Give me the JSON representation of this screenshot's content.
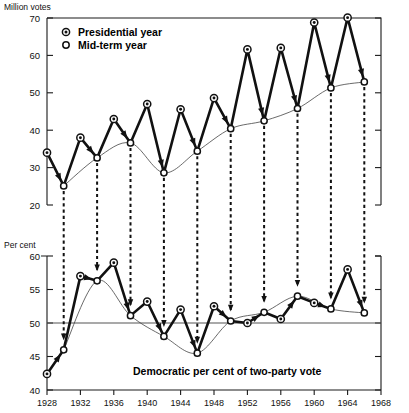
{
  "figure": {
    "background": "#ffffff",
    "ink_color": "#111111"
  },
  "legend": {
    "position": "top-left-inside",
    "entries": [
      {
        "marker": "presidential-year-marker-icon",
        "label": "Presidential year",
        "style": "circle-with-center-dot"
      },
      {
        "marker": "mid-term-year-marker-icon",
        "label": "Mid-term year",
        "style": "open-circle"
      }
    ]
  },
  "top_panel": {
    "axis_title": "Million votes",
    "y_ticks": [
      20,
      30,
      40,
      50,
      60,
      70
    ],
    "y_tick_labels": [
      "20",
      "30",
      "40",
      "50",
      "60",
      "70"
    ]
  },
  "bottom_panel": {
    "axis_title": "Per cent",
    "y_ticks": [
      40,
      45,
      50,
      55,
      60
    ],
    "y_tick_labels": [
      "40",
      "45",
      "50",
      "55",
      "60"
    ],
    "caption": "Democratic per cent of two-party vote",
    "reference_line_value": 50
  },
  "x_axis": {
    "ticks": [
      1928,
      1932,
      1936,
      1940,
      1944,
      1948,
      1952,
      1956,
      1960,
      1964,
      1968
    ],
    "tick_labels": [
      "1928",
      "1932",
      "1936",
      "1940",
      "1944",
      "1948",
      "1952",
      "1956",
      "1960",
      "1964",
      "1968"
    ],
    "range": [
      1928,
      1968
    ]
  },
  "chart_data": [
    {
      "type": "line",
      "id": "turnout-million-votes",
      "title": "Million votes",
      "xlabel": "",
      "ylabel": "Million votes",
      "xlim": [
        1928,
        1968
      ],
      "ylim": [
        20,
        70
      ],
      "grid": false,
      "legend_position": "upper left",
      "x": [
        1928,
        1930,
        1932,
        1934,
        1936,
        1938,
        1940,
        1942,
        1944,
        1946,
        1948,
        1950,
        1952,
        1954,
        1956,
        1958,
        1960,
        1962,
        1964,
        1966
      ],
      "series": [
        {
          "name": "Total vote",
          "point_types": [
            "presidential",
            "mid-term",
            "presidential",
            "mid-term",
            "presidential",
            "mid-term",
            "presidential",
            "mid-term",
            "presidential",
            "mid-term",
            "presidential",
            "mid-term",
            "presidential",
            "mid-term",
            "presidential",
            "mid-term",
            "presidential",
            "mid-term",
            "presidential",
            "mid-term"
          ],
          "values": [
            34.0,
            25.1,
            38.0,
            32.6,
            43.0,
            36.6,
            47.0,
            28.6,
            45.6,
            34.4,
            48.6,
            40.4,
            61.6,
            42.5,
            62.0,
            45.8,
            68.8,
            51.3,
            70.1,
            52.9
          ]
        },
        {
          "name": "Mid-term trend (smoothed)",
          "style": "thin-smooth-curve-through-mid-term-points",
          "values": [
            null,
            25.1,
            null,
            32.6,
            null,
            36.6,
            null,
            28.6,
            null,
            34.4,
            null,
            40.4,
            null,
            42.5,
            null,
            45.8,
            null,
            51.3,
            null,
            52.9
          ]
        }
      ],
      "annotations": {
        "arrows": "bold arrowheads on each presidential-to-mid-term descending segment",
        "drop_lines": "vertical dashed lines at each mid-term year linking the two panels"
      }
    },
    {
      "type": "line",
      "id": "democratic-percent-two-party-vote",
      "title": "Democratic per cent of two-party vote",
      "xlabel": "",
      "ylabel": "Per cent",
      "xlim": [
        1928,
        1968
      ],
      "ylim": [
        40,
        60
      ],
      "grid": false,
      "reference_lines": [
        {
          "y": 50,
          "style": "solid-thin"
        }
      ],
      "x": [
        1928,
        1930,
        1932,
        1934,
        1936,
        1938,
        1940,
        1942,
        1944,
        1946,
        1948,
        1950,
        1952,
        1954,
        1956,
        1958,
        1960,
        1962,
        1964,
        1966
      ],
      "series": [
        {
          "name": "Democratic per cent",
          "point_types": [
            "presidential",
            "mid-term",
            "presidential",
            "mid-term",
            "presidential",
            "mid-term",
            "presidential",
            "mid-term",
            "presidential",
            "mid-term",
            "presidential",
            "mid-term",
            "presidential",
            "mid-term",
            "presidential",
            "mid-term",
            "presidential",
            "mid-term",
            "presidential",
            "mid-term"
          ],
          "values": [
            42.4,
            46.0,
            57.0,
            56.3,
            59.0,
            51.1,
            53.2,
            48.0,
            52.0,
            45.5,
            52.5,
            50.3,
            50.0,
            51.6,
            50.6,
            54.0,
            53.0,
            52.1,
            58.0,
            51.5
          ]
        },
        {
          "name": "Mid-term trend (smoothed)",
          "style": "thin-smooth-curve-through-mid-term-points",
          "values": [
            null,
            46.0,
            null,
            56.3,
            null,
            51.1,
            null,
            48.0,
            null,
            45.5,
            null,
            50.3,
            null,
            51.6,
            null,
            54.0,
            null,
            52.1,
            null,
            51.5
          ]
        }
      ],
      "annotations": {
        "arrows": "bold arrowheads on each presidential-to-mid-term segment",
        "drop_lines": "vertical dashed lines from the upper panel terminate with arrowheads on this panel"
      }
    }
  ]
}
